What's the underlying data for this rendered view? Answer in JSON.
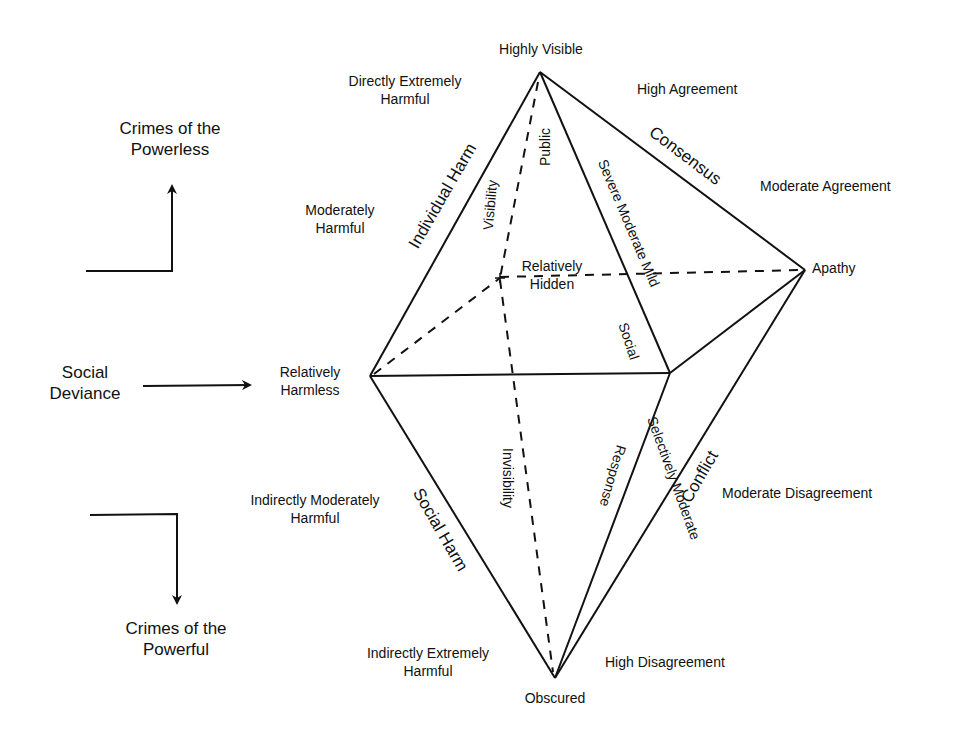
{
  "left_panel": {
    "powerless": {
      "line1": "Crimes of the",
      "line2": "Powerless"
    },
    "deviance": {
      "line1": "Social",
      "line2": "Deviance"
    },
    "powerful": {
      "line1": "Crimes of the",
      "line2": "Powerful"
    }
  },
  "vertices": {
    "top": "Highly Visible",
    "right": "Apathy",
    "left": {
      "line1": "Relatively",
      "line2": "Harmless"
    },
    "back": {
      "line1": "Relatively",
      "line2": "Hidden"
    },
    "bottom": "Obscured"
  },
  "harm_scale": {
    "directly_extreme": {
      "line1": "Directly Extremely",
      "line2": "Harmful"
    },
    "moderate": {
      "line1": "Moderately",
      "line2": "Harmful"
    },
    "indirect_moderate": {
      "line1": "Indirectly Moderately",
      "line2": "Harmful"
    },
    "indirect_extreme": {
      "line1": "Indirectly Extremely",
      "line2": "Harmful"
    }
  },
  "agreement_scale": {
    "high_agreement": "High Agreement",
    "moderate_agreement": "Moderate Agreement",
    "moderate_disagreement": "Moderate Disagreement",
    "high_disagreement": "High Disagreement"
  },
  "edge_labels": {
    "individual_harm": "Individual Harm",
    "social_harm": "Social Harm",
    "consensus": "Consensus",
    "conflict": "Conflict",
    "visibility": "Visibility",
    "public": "Public",
    "invisibility": "Invisibility",
    "severity": "Severe Moderate Mild",
    "social": "Social",
    "selectively_moderate": "Selectively Moderate",
    "response": "Response"
  }
}
